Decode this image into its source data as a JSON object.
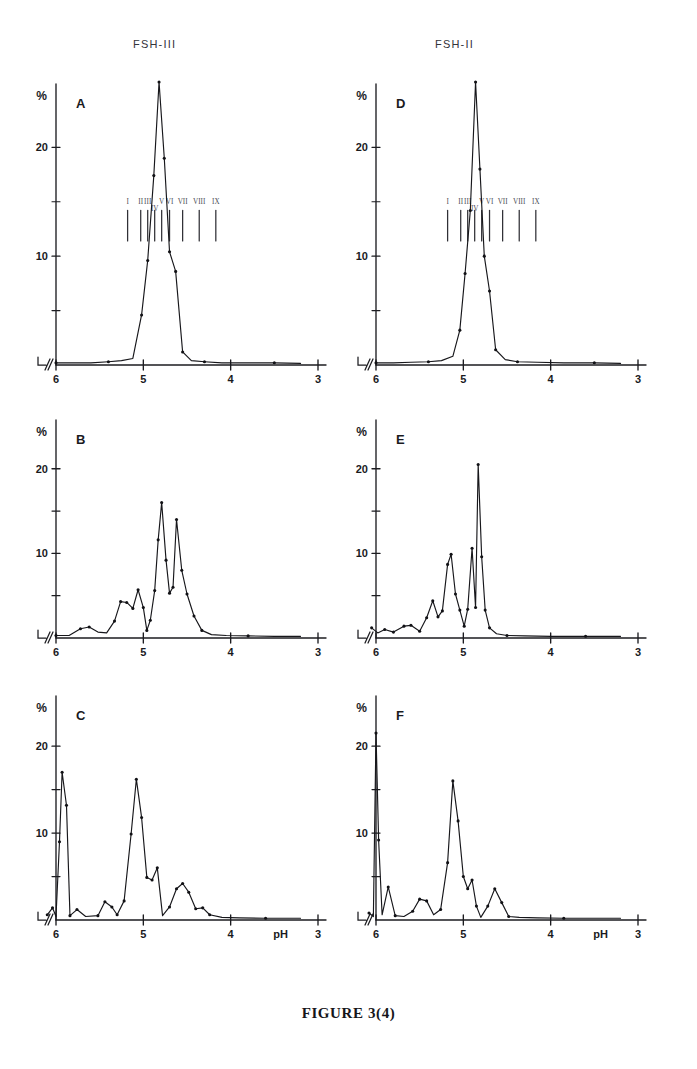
{
  "figure": {
    "caption": "FIGURE 3(4)",
    "column_titles": {
      "left": "FSH-III",
      "right": "FSH-II"
    },
    "axis": {
      "y_title": "%",
      "x_title": "pH",
      "x_ticks": [
        "6",
        "5",
        "4",
        "3"
      ],
      "y_ticks": [
        "20",
        "10"
      ],
      "x_range": [
        6.0,
        3.0
      ],
      "y_range": [
        0,
        26
      ],
      "axis_break_symbol": "//"
    },
    "component_labels": [
      "I",
      "II",
      "III",
      "IV",
      "V",
      "VI",
      "VII",
      "VIII",
      "IX"
    ],
    "panel_letters": [
      "A",
      "B",
      "C",
      "D",
      "E",
      "F"
    ]
  },
  "chart_data": {
    "type": "line",
    "xlabel": "pH",
    "ylabel": "%",
    "xlim": [
      6.0,
      3.0
    ],
    "ylim": [
      0,
      26
    ],
    "grid": false,
    "legend": "none",
    "x_ticks": [
      6,
      5,
      4,
      3
    ],
    "y_ticks": [
      0,
      5,
      10,
      15,
      20
    ],
    "y_minor_ticks": [
      5,
      15
    ],
    "note": "x-axis is reversed (pH decreasing left to right); axis origin carries a break mark",
    "component_markers": {
      "labels": [
        "I",
        "II",
        "III",
        "IV",
        "V",
        "VI",
        "VII",
        "VIII",
        "IX"
      ],
      "ph_positions": [
        5.18,
        5.03,
        4.95,
        4.87,
        4.79,
        4.7,
        4.55,
        4.36,
        4.17
      ],
      "shown_in_panels": [
        "A",
        "D"
      ]
    },
    "panels": [
      {
        "panel": "A",
        "group": "FSH-III",
        "series_name": "FSH-III whole preparation",
        "points": [
          {
            "ph": 6.0,
            "value": 0.2
          },
          {
            "ph": 5.8,
            "value": 0.2
          },
          {
            "ph": 5.6,
            "value": 0.2
          },
          {
            "ph": 5.4,
            "value": 0.3
          },
          {
            "ph": 5.25,
            "value": 0.4
          },
          {
            "ph": 5.12,
            "value": 0.6
          },
          {
            "ph": 5.02,
            "value": 4.6
          },
          {
            "ph": 4.95,
            "value": 9.6
          },
          {
            "ph": 4.88,
            "value": 17.4
          },
          {
            "ph": 4.82,
            "value": 26.0
          },
          {
            "ph": 4.76,
            "value": 19.0
          },
          {
            "ph": 4.7,
            "value": 10.4
          },
          {
            "ph": 4.63,
            "value": 8.6
          },
          {
            "ph": 4.55,
            "value": 1.2
          },
          {
            "ph": 4.45,
            "value": 0.4
          },
          {
            "ph": 4.3,
            "value": 0.3
          },
          {
            "ph": 4.1,
            "value": 0.2
          },
          {
            "ph": 3.8,
            "value": 0.2
          },
          {
            "ph": 3.5,
            "value": 0.2
          },
          {
            "ph": 3.2,
            "value": 0.15
          }
        ]
      },
      {
        "panel": "B",
        "group": "FSH-III",
        "series_name": "FSH-III fraction B",
        "points": [
          {
            "ph": 6.0,
            "value": 0.3
          },
          {
            "ph": 5.85,
            "value": 0.3
          },
          {
            "ph": 5.72,
            "value": 1.1
          },
          {
            "ph": 5.62,
            "value": 1.3
          },
          {
            "ph": 5.52,
            "value": 0.7
          },
          {
            "ph": 5.42,
            "value": 0.6
          },
          {
            "ph": 5.33,
            "value": 2.0
          },
          {
            "ph": 5.26,
            "value": 4.3
          },
          {
            "ph": 5.19,
            "value": 4.2
          },
          {
            "ph": 5.12,
            "value": 3.5
          },
          {
            "ph": 5.06,
            "value": 5.7
          },
          {
            "ph": 5.0,
            "value": 3.6
          },
          {
            "ph": 4.96,
            "value": 0.9
          },
          {
            "ph": 4.92,
            "value": 2.1
          },
          {
            "ph": 4.87,
            "value": 5.6
          },
          {
            "ph": 4.83,
            "value": 11.6
          },
          {
            "ph": 4.79,
            "value": 16.0
          },
          {
            "ph": 4.74,
            "value": 9.2
          },
          {
            "ph": 4.7,
            "value": 5.3
          },
          {
            "ph": 4.66,
            "value": 6.0
          },
          {
            "ph": 4.62,
            "value": 14.0
          },
          {
            "ph": 4.56,
            "value": 8.0
          },
          {
            "ph": 4.5,
            "value": 5.2
          },
          {
            "ph": 4.42,
            "value": 2.6
          },
          {
            "ph": 4.33,
            "value": 0.9
          },
          {
            "ph": 4.22,
            "value": 0.4
          },
          {
            "ph": 4.05,
            "value": 0.3
          },
          {
            "ph": 3.8,
            "value": 0.25
          },
          {
            "ph": 3.5,
            "value": 0.2
          },
          {
            "ph": 3.2,
            "value": 0.2
          }
        ]
      },
      {
        "panel": "C",
        "group": "FSH-III",
        "series_name": "FSH-III fraction C",
        "points": [
          {
            "ph": 6.1,
            "value": 0.6
          },
          {
            "ph": 6.04,
            "value": 1.4
          },
          {
            "ph": 6.0,
            "value": 0.4
          },
          {
            "ph": 5.96,
            "value": 9.0
          },
          {
            "ph": 5.93,
            "value": 17.0
          },
          {
            "ph": 5.88,
            "value": 13.2
          },
          {
            "ph": 5.84,
            "value": 0.5
          },
          {
            "ph": 5.76,
            "value": 1.2
          },
          {
            "ph": 5.66,
            "value": 0.4
          },
          {
            "ph": 5.52,
            "value": 0.5
          },
          {
            "ph": 5.44,
            "value": 2.1
          },
          {
            "ph": 5.36,
            "value": 1.5
          },
          {
            "ph": 5.3,
            "value": 0.6
          },
          {
            "ph": 5.22,
            "value": 2.2
          },
          {
            "ph": 5.14,
            "value": 9.9
          },
          {
            "ph": 5.08,
            "value": 16.2
          },
          {
            "ph": 5.02,
            "value": 11.8
          },
          {
            "ph": 4.96,
            "value": 4.9
          },
          {
            "ph": 4.9,
            "value": 4.6
          },
          {
            "ph": 4.84,
            "value": 6.0
          },
          {
            "ph": 4.78,
            "value": 0.5
          },
          {
            "ph": 4.7,
            "value": 1.5
          },
          {
            "ph": 4.62,
            "value": 3.6
          },
          {
            "ph": 4.55,
            "value": 4.2
          },
          {
            "ph": 4.48,
            "value": 3.2
          },
          {
            "ph": 4.4,
            "value": 1.3
          },
          {
            "ph": 4.32,
            "value": 1.4
          },
          {
            "ph": 4.24,
            "value": 0.6
          },
          {
            "ph": 4.1,
            "value": 0.3
          },
          {
            "ph": 3.9,
            "value": 0.25
          },
          {
            "ph": 3.6,
            "value": 0.2
          },
          {
            "ph": 3.2,
            "value": 0.2
          }
        ]
      },
      {
        "panel": "D",
        "group": "FSH-II",
        "series_name": "FSH-II whole preparation",
        "points": [
          {
            "ph": 6.0,
            "value": 0.2
          },
          {
            "ph": 5.8,
            "value": 0.2
          },
          {
            "ph": 5.6,
            "value": 0.25
          },
          {
            "ph": 5.4,
            "value": 0.3
          },
          {
            "ph": 5.25,
            "value": 0.4
          },
          {
            "ph": 5.12,
            "value": 0.8
          },
          {
            "ph": 5.04,
            "value": 3.2
          },
          {
            "ph": 4.98,
            "value": 8.4
          },
          {
            "ph": 4.92,
            "value": 14.2
          },
          {
            "ph": 4.86,
            "value": 26.0
          },
          {
            "ph": 4.81,
            "value": 18.0
          },
          {
            "ph": 4.76,
            "value": 10.0
          },
          {
            "ph": 4.7,
            "value": 6.8
          },
          {
            "ph": 4.63,
            "value": 1.4
          },
          {
            "ph": 4.52,
            "value": 0.5
          },
          {
            "ph": 4.38,
            "value": 0.3
          },
          {
            "ph": 4.15,
            "value": 0.25
          },
          {
            "ph": 3.85,
            "value": 0.2
          },
          {
            "ph": 3.5,
            "value": 0.2
          },
          {
            "ph": 3.2,
            "value": 0.15
          }
        ]
      },
      {
        "panel": "E",
        "group": "FSH-II",
        "series_name": "FSH-II fraction E",
        "points": [
          {
            "ph": 6.05,
            "value": 1.2
          },
          {
            "ph": 5.98,
            "value": 0.6
          },
          {
            "ph": 5.9,
            "value": 1.0
          },
          {
            "ph": 5.8,
            "value": 0.7
          },
          {
            "ph": 5.68,
            "value": 1.4
          },
          {
            "ph": 5.6,
            "value": 1.5
          },
          {
            "ph": 5.5,
            "value": 0.8
          },
          {
            "ph": 5.42,
            "value": 2.4
          },
          {
            "ph": 5.35,
            "value": 4.4
          },
          {
            "ph": 5.29,
            "value": 2.5
          },
          {
            "ph": 5.24,
            "value": 3.2
          },
          {
            "ph": 5.18,
            "value": 8.7
          },
          {
            "ph": 5.14,
            "value": 9.9
          },
          {
            "ph": 5.09,
            "value": 5.2
          },
          {
            "ph": 5.04,
            "value": 3.3
          },
          {
            "ph": 4.99,
            "value": 1.4
          },
          {
            "ph": 4.95,
            "value": 3.4
          },
          {
            "ph": 4.9,
            "value": 10.6
          },
          {
            "ph": 4.86,
            "value": 3.6
          },
          {
            "ph": 4.83,
            "value": 20.5
          },
          {
            "ph": 4.79,
            "value": 9.6
          },
          {
            "ph": 4.75,
            "value": 3.3
          },
          {
            "ph": 4.7,
            "value": 1.2
          },
          {
            "ph": 4.62,
            "value": 0.5
          },
          {
            "ph": 4.5,
            "value": 0.3
          },
          {
            "ph": 4.3,
            "value": 0.25
          },
          {
            "ph": 4.0,
            "value": 0.2
          },
          {
            "ph": 3.6,
            "value": 0.2
          },
          {
            "ph": 3.2,
            "value": 0.2
          }
        ]
      },
      {
        "panel": "F",
        "group": "FSH-II",
        "series_name": "FSH-II fraction F",
        "points": [
          {
            "ph": 6.08,
            "value": 0.8
          },
          {
            "ph": 6.03,
            "value": 0.4
          },
          {
            "ph": 6.0,
            "value": 21.5
          },
          {
            "ph": 5.97,
            "value": 9.2
          },
          {
            "ph": 5.93,
            "value": 0.6
          },
          {
            "ph": 5.86,
            "value": 3.8
          },
          {
            "ph": 5.78,
            "value": 0.5
          },
          {
            "ph": 5.68,
            "value": 0.4
          },
          {
            "ph": 5.58,
            "value": 1.0
          },
          {
            "ph": 5.5,
            "value": 2.4
          },
          {
            "ph": 5.42,
            "value": 2.2
          },
          {
            "ph": 5.34,
            "value": 0.6
          },
          {
            "ph": 5.26,
            "value": 1.2
          },
          {
            "ph": 5.18,
            "value": 6.6
          },
          {
            "ph": 5.12,
            "value": 16.0
          },
          {
            "ph": 5.06,
            "value": 11.4
          },
          {
            "ph": 5.0,
            "value": 5.0
          },
          {
            "ph": 4.95,
            "value": 3.6
          },
          {
            "ph": 4.9,
            "value": 4.6
          },
          {
            "ph": 4.85,
            "value": 1.6
          },
          {
            "ph": 4.8,
            "value": 0.3
          },
          {
            "ph": 4.72,
            "value": 1.6
          },
          {
            "ph": 4.64,
            "value": 3.6
          },
          {
            "ph": 4.56,
            "value": 2.0
          },
          {
            "ph": 4.48,
            "value": 0.4
          },
          {
            "ph": 4.36,
            "value": 0.3
          },
          {
            "ph": 4.15,
            "value": 0.25
          },
          {
            "ph": 3.85,
            "value": 0.2
          },
          {
            "ph": 3.5,
            "value": 0.2
          },
          {
            "ph": 3.2,
            "value": 0.2
          }
        ]
      }
    ]
  }
}
